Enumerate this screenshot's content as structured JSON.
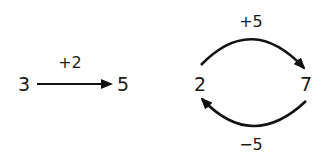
{
  "left_diagram": {
    "from": "3",
    "to": "5",
    "operation": "+2"
  },
  "right_diagram": {
    "left_node": "2",
    "right_node": "7",
    "top_operation": "+5",
    "bottom_operation": "−5"
  },
  "colors": {
    "stroke": "#111111",
    "text": "#1a1a1a"
  }
}
